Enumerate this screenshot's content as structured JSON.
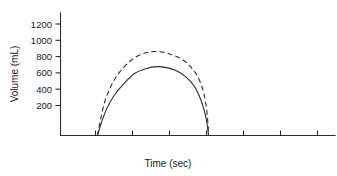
{
  "chart_data": {
    "type": "line",
    "title": "",
    "xlabel": "Time (sec)",
    "ylabel": "Volume (mL)",
    "xlim": [
      0,
      7.5
    ],
    "ylim": [
      0,
      1300
    ],
    "grid": false,
    "legend": "none",
    "y_ticks": [
      200,
      400,
      600,
      800,
      1000,
      1200
    ],
    "y_tick_labels": [
      "200",
      "400",
      "600",
      "800",
      "1000",
      "1200"
    ],
    "x_ticks": [
      1,
      2,
      3,
      4,
      5,
      6,
      7
    ],
    "x_tick_labels": [
      "",
      "",
      "",
      "",
      "",
      "",
      ""
    ],
    "series": [
      {
        "name": "solid-curve",
        "style": "solid",
        "color": "#2b2b2b",
        "x": [
          1.0,
          1.1,
          1.25,
          1.45,
          1.7,
          2.0,
          2.3,
          2.6,
          2.9,
          3.1,
          3.3,
          3.5,
          3.65,
          3.8,
          3.9,
          3.97,
          4.0
        ],
        "y": [
          0,
          150,
          330,
          490,
          630,
          760,
          820,
          845,
          830,
          800,
          750,
          670,
          580,
          430,
          280,
          120,
          0
        ],
        "peak_value": 845
      },
      {
        "name": "dashed-curve",
        "style": "dashed",
        "color": "#2b2b2b",
        "x": [
          1.0,
          1.08,
          1.2,
          1.38,
          1.6,
          1.9,
          2.2,
          2.5,
          2.8,
          3.05,
          3.3,
          3.5,
          3.7,
          3.85,
          3.93,
          3.98,
          4.0
        ],
        "y": [
          0,
          190,
          420,
          620,
          780,
          920,
          1000,
          1030,
          1020,
          985,
          930,
          850,
          730,
          560,
          380,
          180,
          0
        ],
        "peak_value": 1030
      }
    ]
  },
  "axes": {
    "y_axis_label": "Volume (mL)",
    "x_axis_label": "Time (sec)"
  }
}
